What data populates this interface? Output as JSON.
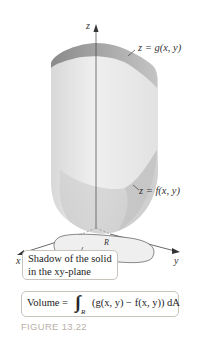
{
  "figure": {
    "caption": "FIGURE 13.22",
    "axes": {
      "z_label": "z",
      "x_label": "x",
      "y_label": "y"
    },
    "surfaces": {
      "top_label": "z = g(x, y)",
      "bottom_label": "z = f(x, y)"
    },
    "region": {
      "label": "R"
    },
    "callouts": {
      "shadow_line1": "Shadow of the solid",
      "shadow_line2": "in the xy-plane"
    },
    "volume_formula": {
      "prefix": "Volume =",
      "integral": "∫∫",
      "subscript": "R",
      "expression": "(g(x, y) − f(x, y)) dA"
    },
    "colors": {
      "surface_top": "#9a9a9a",
      "surface_body": "#e6e6e6",
      "region_fill": "#efefef",
      "caption": "#b8b0a8"
    }
  }
}
